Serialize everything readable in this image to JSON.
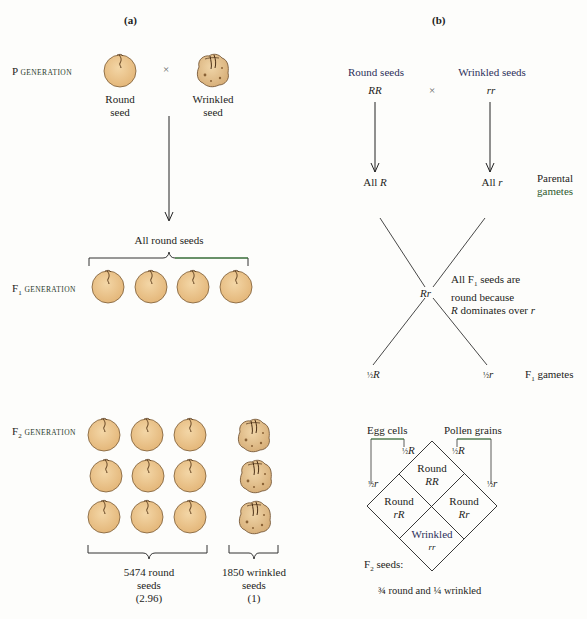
{
  "panel_a": {
    "label": "(a)",
    "p_generation": {
      "prefix": "P",
      "suffix": "generation"
    },
    "cross_symbol": "×",
    "parent_round": {
      "line1": "Round",
      "line2": "seed"
    },
    "parent_wrinkled": {
      "line1": "Wrinkled",
      "line2": "seed"
    },
    "f1_caption": "All round seeds",
    "f1_generation": {
      "prefix": "F",
      "sub": "1",
      "suffix": "generation"
    },
    "f1_seed_count": 4,
    "f2_generation": {
      "prefix": "F",
      "sub": "2",
      "suffix": "generation"
    },
    "f2_round": {
      "line1": "5474 round",
      "line2": "seeds",
      "line3": "(2.96)"
    },
    "f2_wrinkled": {
      "line1": "1850 wrinkled",
      "line2": "seeds",
      "line3": "(1)"
    },
    "colors": {
      "seed_fill": "#ebc48a",
      "seed_stroke": "#6a4a2a",
      "brace_green": "#3a8a3a"
    }
  },
  "panel_b": {
    "label": "(b)",
    "round_seeds": "Round seeds",
    "wrinkled_seeds": "Wrinkled seeds",
    "genotype_rr_dominant": "RR",
    "genotype_rr_recessive": "rr",
    "cross_symbol": "×",
    "all_R": {
      "text": "All",
      "allele": "R"
    },
    "all_r": {
      "text": "All",
      "allele": "r"
    },
    "parental_gametes": {
      "line1": "Parental",
      "line2": "gametes"
    },
    "f1_genotype": "Rr",
    "f1_note": {
      "line1_pre": "All F",
      "line1_sub": "1",
      "line1_post": " seeds are",
      "line2": "round because",
      "line3_allele": "R",
      "line3_mid": " dominates over ",
      "line3_allele2": "r"
    },
    "f1_gamete_R": {
      "frac": "½",
      "allele": "R"
    },
    "f1_gamete_r": {
      "frac": "½",
      "allele": "r"
    },
    "f1_gametes_label": {
      "prefix": "F",
      "sub": "1",
      "suffix": " gametes"
    },
    "egg_cells": "Egg cells",
    "pollen_grains": "Pollen grains",
    "egg_R": {
      "frac": "½",
      "allele": "R"
    },
    "egg_r": {
      "frac": "½",
      "allele": "r"
    },
    "pollen_R": {
      "frac": "½",
      "allele": "R"
    },
    "pollen_r": {
      "frac": "½",
      "allele": "r"
    },
    "punnett": [
      {
        "phenotype": "Round",
        "genotype": "RR",
        "position": "top"
      },
      {
        "phenotype": "Round",
        "genotype": "rR",
        "position": "left"
      },
      {
        "phenotype": "Round",
        "genotype": "Rr",
        "position": "right"
      },
      {
        "phenotype": "Wrinkled",
        "genotype": "rr",
        "position": "bottom"
      }
    ],
    "f2_seeds_label": {
      "prefix": "F",
      "sub": "2",
      "suffix": " seeds:"
    },
    "f2_ratio": "¾ round and ¼ wrinkled"
  }
}
